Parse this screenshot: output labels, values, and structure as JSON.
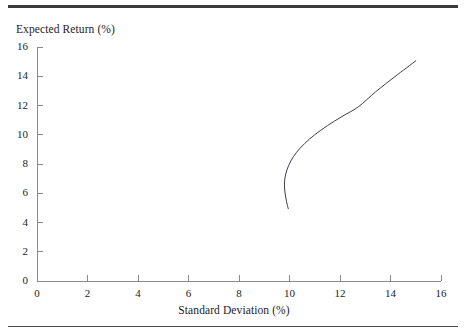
{
  "figure": {
    "background_color": "#ffffff",
    "line_color": "#3c3c46",
    "axis_color": "#8a8a8a",
    "text_color": "#1c1c1c",
    "top_rule_color": "#3a3a3a",
    "bottom_rule_color": "#4a4a4a"
  },
  "chart_data": {
    "type": "line",
    "title": "",
    "xlabel": "Standard Deviation (%)",
    "ylabel": "Expected Return (%)",
    "xlim": [
      0,
      16
    ],
    "ylim": [
      0,
      16
    ],
    "xticks": [
      0,
      2,
      4,
      6,
      8,
      10,
      12,
      14,
      16
    ],
    "xtick_labels": [
      "0",
      "2",
      "4",
      "6",
      "8",
      "10",
      "12",
      "14",
      "16"
    ],
    "yticks": [
      0,
      2,
      4,
      6,
      8,
      10,
      12,
      14,
      16
    ],
    "ytick_labels": [
      "0",
      "2",
      "4",
      "6",
      "8",
      "10",
      "12",
      "14",
      "16"
    ],
    "grid": false,
    "legend": null,
    "series": [
      {
        "name": "Minimum-variance frontier",
        "x": [
          9.95,
          9.88,
          9.83,
          9.8,
          9.82,
          9.9,
          10.05,
          10.28,
          10.6,
          11.0,
          11.5,
          12.08,
          12.72,
          13.42,
          14.18,
          15.0
        ],
        "y": [
          4.95,
          5.45,
          5.95,
          6.5,
          7.05,
          7.6,
          8.2,
          8.8,
          9.4,
          10.0,
          10.62,
          11.25,
          11.9,
          12.95,
          13.98,
          15.05
        ]
      }
    ],
    "annotations": {
      "minimum_variance_point": {
        "x": 9.8,
        "y": 7.05
      },
      "lower_endpoint": {
        "x": 9.95,
        "y": 4.95
      },
      "upper_endpoint": {
        "x": 15.0,
        "y": 15.05
      }
    }
  }
}
